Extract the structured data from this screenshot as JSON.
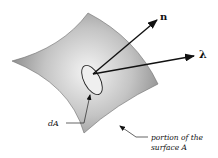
{
  "diagram": {
    "labels": {
      "normal": "n",
      "direction": "λ",
      "area_element": "dA",
      "surface_line1": "portion of the",
      "surface_line2": "surface A"
    },
    "colors": {
      "surface_light": "#f2f2f2",
      "surface_dark": "#8a8a8a",
      "stroke": "#111111"
    }
  }
}
